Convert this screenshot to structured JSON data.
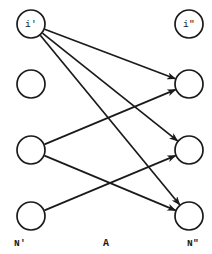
{
  "figure": {
    "width": 212,
    "height": 254,
    "background": "#ffffff",
    "ink_color": "#1a1a1a",
    "center_caption": "A",
    "left_set_caption": "N'",
    "right_set_caption": "N\""
  },
  "chart_data": {
    "type": "diagram",
    "title": "",
    "subtitle": "",
    "xlabel": "",
    "ylabel": "",
    "layout": "bipartite two-column node-link diagram, arrows point left-to-right",
    "nodes": [
      {
        "id": "L1",
        "column": "left",
        "x": 31,
        "y": 24,
        "r": 14,
        "label": "i'",
        "label_inside": true
      },
      {
        "id": "L2",
        "column": "left",
        "x": 31,
        "y": 84,
        "r": 14,
        "label": "",
        "label_inside": false
      },
      {
        "id": "L3",
        "column": "left",
        "x": 31,
        "y": 150,
        "r": 14,
        "label": "",
        "label_inside": false
      },
      {
        "id": "L4",
        "column": "left",
        "x": 31,
        "y": 216,
        "r": 14,
        "label": "",
        "label_inside": false
      },
      {
        "id": "R1",
        "column": "right",
        "x": 189,
        "y": 24,
        "r": 14,
        "label": "i\"",
        "label_inside": true
      },
      {
        "id": "R2",
        "column": "right",
        "x": 189,
        "y": 84,
        "r": 14,
        "label": "",
        "label_inside": false
      },
      {
        "id": "R3",
        "column": "right",
        "x": 189,
        "y": 150,
        "r": 14,
        "label": "",
        "label_inside": false
      },
      {
        "id": "R4",
        "column": "right",
        "x": 189,
        "y": 216,
        "r": 14,
        "label": "",
        "label_inside": false
      }
    ],
    "edges": [
      {
        "from": "L1",
        "to": "R2",
        "arrow": true
      },
      {
        "from": "L1",
        "to": "R3",
        "arrow": true
      },
      {
        "from": "L1",
        "to": "R4",
        "arrow": true
      },
      {
        "from": "L3",
        "to": "R2",
        "arrow": true
      },
      {
        "from": "L3",
        "to": "R4",
        "arrow": true
      },
      {
        "from": "L4",
        "to": "R3",
        "arrow": true
      }
    ],
    "outer_labels": [
      {
        "id": "left-set",
        "text": "N'",
        "x": 20,
        "y": 243
      },
      {
        "id": "center",
        "text": "A",
        "x": 106,
        "y": 243
      },
      {
        "id": "right-set",
        "text": "N\"",
        "x": 193,
        "y": 243
      }
    ]
  }
}
